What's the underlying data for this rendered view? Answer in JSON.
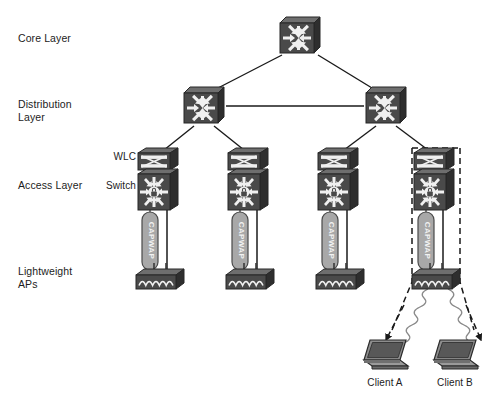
{
  "diagram": {
    "background": "#ffffff",
    "width": 503,
    "height": 396
  },
  "palette": {
    "device_dark": "#4a4a4a",
    "device_top": "#6e6e6e",
    "device_side": "#2e2e2e",
    "device_glyph": "#f0f0f0",
    "tunnel_fill": "#a8a8a8",
    "tunnel_stroke": "#4a4a4a",
    "line": "#1a1a1a",
    "dashed": "#1a1a1a",
    "text": "#1c1c1c",
    "laptop_screen": "#585858",
    "laptop_base": "#8d8d8d"
  },
  "layer_labels": [
    {
      "id": "core",
      "text": "Core Layer",
      "x": 18,
      "y": 32
    },
    {
      "id": "distribution",
      "text": "Distribution\nLayer",
      "x": 18,
      "y": 98
    },
    {
      "id": "access",
      "text": "Access Layer",
      "x": 18,
      "y": 179
    },
    {
      "id": "lightweight-aps",
      "text": "Lightweight\nAPs",
      "x": 18,
      "y": 265
    }
  ],
  "node_labels": [
    {
      "id": "wlc",
      "text": "WLC",
      "x": 84,
      "y": 151,
      "width": 52
    },
    {
      "id": "switch",
      "text": "Switch",
      "x": 84,
      "y": 180,
      "width": 52
    }
  ],
  "core_switches": [
    {
      "id": "core-1",
      "name": "core-switch",
      "cx": 300,
      "cy": 36
    }
  ],
  "distribution_switches": [
    {
      "id": "dist-1",
      "name": "distribution-switch-left",
      "cx": 204,
      "cy": 106
    },
    {
      "id": "dist-2",
      "name": "distribution-switch-right",
      "cx": 386,
      "cy": 106
    }
  ],
  "access_stacks": [
    {
      "id": "access-1",
      "name": "access-stack-1",
      "cx": 158,
      "wlc_y": 158,
      "switch_y": 185,
      "highlighted": false
    },
    {
      "id": "access-2",
      "name": "access-stack-2",
      "cx": 248,
      "wlc_y": 158,
      "switch_y": 185,
      "highlighted": false
    },
    {
      "id": "access-3",
      "name": "access-stack-3",
      "cx": 338,
      "wlc_y": 158,
      "switch_y": 185,
      "highlighted": false
    },
    {
      "id": "access-4",
      "name": "access-stack-4",
      "cx": 434,
      "wlc_y": 158,
      "switch_y": 185,
      "highlighted": true
    }
  ],
  "capwap_tunnels": [
    {
      "id": "capwap-1",
      "label": "CAPWAP",
      "cx": 150,
      "top": 212,
      "bottom": 270
    },
    {
      "id": "capwap-2",
      "label": "CAPWAP",
      "cx": 240,
      "top": 212,
      "bottom": 270
    },
    {
      "id": "capwap-3",
      "label": "CAPWAP",
      "cx": 330,
      "top": 212,
      "bottom": 270
    },
    {
      "id": "capwap-4",
      "label": "CAPWAP",
      "cx": 426,
      "top": 212,
      "bottom": 270
    }
  ],
  "access_points": [
    {
      "id": "ap-1",
      "name": "lightweight-ap-1",
      "cx": 158,
      "cy": 276,
      "highlighted": false
    },
    {
      "id": "ap-2",
      "name": "lightweight-ap-2",
      "cx": 248,
      "cy": 276,
      "highlighted": false
    },
    {
      "id": "ap-3",
      "name": "lightweight-ap-3",
      "cx": 338,
      "cy": 276,
      "highlighted": false
    },
    {
      "id": "ap-4",
      "name": "lightweight-ap-4",
      "cx": 434,
      "cy": 276,
      "highlighted": true
    }
  ],
  "clients": [
    {
      "id": "client-a",
      "label": "Client A",
      "cx": 385,
      "cy": 355,
      "label_y": 377
    },
    {
      "id": "client-b",
      "label": "Client B",
      "cx": 455,
      "cy": 355,
      "label_y": 377
    }
  ],
  "links": [
    {
      "from": "core-1",
      "to": "dist-1",
      "style": "solid"
    },
    {
      "from": "core-1",
      "to": "dist-2",
      "style": "solid"
    },
    {
      "from": "dist-1",
      "to": "dist-2",
      "style": "solid"
    },
    {
      "from": "dist-1",
      "to": "access-1",
      "style": "solid"
    },
    {
      "from": "dist-1",
      "to": "access-2",
      "style": "solid"
    },
    {
      "from": "dist-2",
      "to": "access-3",
      "style": "solid"
    },
    {
      "from": "dist-2",
      "to": "access-4",
      "style": "solid"
    },
    {
      "from": "access-1",
      "to": "ap-1",
      "style": "solid"
    },
    {
      "from": "access-2",
      "to": "ap-2",
      "style": "solid"
    },
    {
      "from": "access-3",
      "to": "ap-3",
      "style": "solid"
    },
    {
      "from": "access-4",
      "to": "ap-4",
      "style": "solid"
    },
    {
      "from": "access-4",
      "to": "client-a",
      "style": "dashed-arrow"
    },
    {
      "from": "access-4",
      "to": "client-b",
      "style": "dashed-arrow"
    },
    {
      "from": "ap-4",
      "to": "client-a",
      "style": "rf-helix"
    },
    {
      "from": "ap-4",
      "to": "client-b",
      "style": "rf-helix"
    }
  ]
}
